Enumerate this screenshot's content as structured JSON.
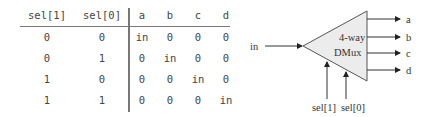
{
  "truth_table": {
    "headers": [
      "sel[1]",
      "sel[0]",
      "a",
      "b",
      "c",
      "d"
    ],
    "rows": [
      [
        "0",
        "0",
        "in",
        "0",
        "0",
        "0"
      ],
      [
        "0",
        "1",
        "0",
        "in",
        "0",
        "0"
      ],
      [
        "1",
        "0",
        "0",
        "0",
        "in",
        "0"
      ],
      [
        "1",
        "1",
        "0",
        "0",
        "0",
        "in"
      ]
    ]
  },
  "diagram": {
    "title_line1": "4-way",
    "title_line2": "DMux",
    "input": "in",
    "outputs": [
      "a",
      "b",
      "c",
      "d"
    ],
    "selects": [
      "sel[1]",
      "sel[0]"
    ]
  }
}
